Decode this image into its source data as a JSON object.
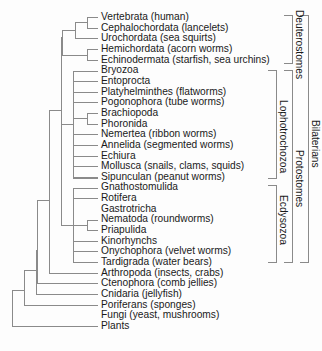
{
  "taxa": [
    {
      "label": "Vertebrata (human)"
    },
    {
      "label": "Cephalochordata (lancelets)"
    },
    {
      "label": "Urochordata (sea squirts)"
    },
    {
      "label": "Hemichordata (acorn worms)"
    },
    {
      "label": "Echinodermata (starfish, sea urchins)"
    },
    {
      "label": "Bryozoa"
    },
    {
      "label": "Entoprocta"
    },
    {
      "label": "Platyhelminthes (flatworms)"
    },
    {
      "label": "Pogonophora (tube worms)"
    },
    {
      "label": "Brachiopoda"
    },
    {
      "label": "Phoronida"
    },
    {
      "label": "Nemertea (ribbon worms)"
    },
    {
      "label": "Annelida (segmented worms)"
    },
    {
      "label": "Echiura"
    },
    {
      "label": "Mollusca (snails, clams, squids)"
    },
    {
      "label": "Sipunculan (peanut worms)"
    },
    {
      "label": "Gnathostomulida"
    },
    {
      "label": "Rotifera"
    },
    {
      "label": "Gastrotricha"
    },
    {
      "label": "Nematoda (roundworms)"
    },
    {
      "label": "Priapulida"
    },
    {
      "label": "Kinorhynchs"
    },
    {
      "label": "Onychophora (velvet worms)"
    },
    {
      "label": "Tardigrada (water bears)"
    },
    {
      "label": "Arthropoda (insects, crabs)"
    },
    {
      "label": "Ctenophora (comb jellies)"
    },
    {
      "label": "Cnidaria (jellyfish)"
    },
    {
      "label": "Poriferans (sponges)"
    },
    {
      "label": "Fungi (yeast, mushrooms)"
    },
    {
      "label": "Plants"
    }
  ],
  "groups": {
    "deuterostomes": "Deuterostomes",
    "lophotrochozoa": "Lophotrochozoa",
    "ecdysozoa": "Ecdysozoa",
    "protostomes": "Protostomes",
    "bilaterians": "Bilaterians"
  },
  "colors": {
    "line": "#8a8a8a",
    "text": "#1a1a1a",
    "background": "#fdfdfd"
  }
}
